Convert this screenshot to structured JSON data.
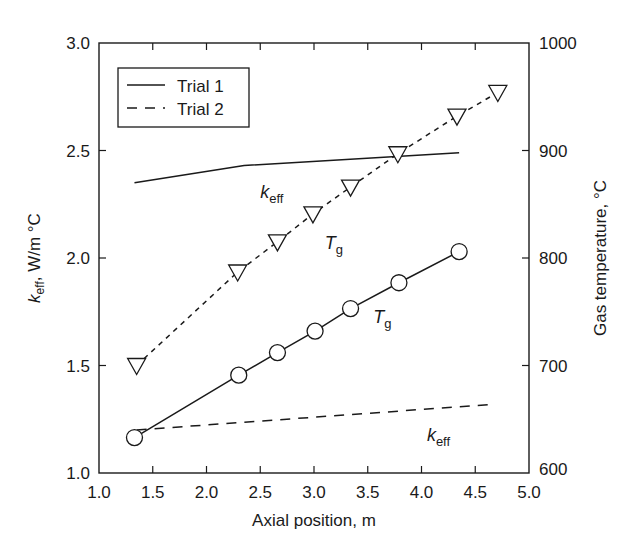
{
  "chart_data": {
    "type": "line",
    "title": "",
    "xlabel": "Axial position, m",
    "ylabel_left": {
      "symbol": "k",
      "subscript": "eff",
      "unit": ", W/m °C"
    },
    "ylabel_right": "Gas temperature, °C",
    "xlim": [
      1.0,
      5.0
    ],
    "ylim_left": [
      1.0,
      3.0
    ],
    "ylim_right": [
      600,
      1000
    ],
    "x_ticks": [
      "1.0",
      "1.5",
      "2.0",
      "2.5",
      "3.0",
      "3.5",
      "4.0",
      "4.5",
      "5.0"
    ],
    "y_left_ticks": [
      "1.0",
      "1.5",
      "2.0",
      "2.5",
      "3.0"
    ],
    "y_right_ticks": [
      "600",
      "700",
      "800",
      "900",
      "1000"
    ],
    "grid": false,
    "legend": {
      "position": "upper-left",
      "entries": [
        {
          "label": "Trial 1",
          "style": "solid"
        },
        {
          "label": "Trial 2",
          "style": "dashed"
        }
      ]
    },
    "series": [
      {
        "name": "Trial 1 k_eff",
        "axis": "left",
        "style": "solid",
        "marker": "none",
        "x": [
          1.33,
          2.35,
          4.35
        ],
        "y": [
          2.35,
          2.43,
          2.49
        ]
      },
      {
        "name": "Trial 2 k_eff",
        "axis": "left",
        "style": "dashed",
        "marker": "none",
        "x": [
          1.35,
          4.68
        ],
        "y": [
          1.2,
          1.32
        ]
      },
      {
        "name": "Trial 1 T_g",
        "axis": "right",
        "style": "solid",
        "marker": "circle",
        "x": [
          1.33,
          2.3,
          2.66,
          3.01,
          3.34,
          3.79,
          4.35
        ],
        "y": [
          633,
          691,
          712,
          732,
          753,
          777,
          806
        ]
      },
      {
        "name": "Trial 2 T_g",
        "axis": "right",
        "style": "dotted",
        "marker": "triangle-down",
        "x": [
          1.35,
          2.29,
          2.66,
          2.99,
          3.34,
          3.78,
          4.33,
          4.71
        ],
        "y": [
          700,
          787,
          815,
          841,
          866,
          897,
          932,
          954
        ]
      }
    ],
    "annotations": [
      {
        "text": "k",
        "sub": "eff",
        "x": 2.5,
        "y_left": 2.28,
        "series": "Trial 1 k_eff"
      },
      {
        "text": "T",
        "sub": "g",
        "x": 3.1,
        "y_left": 2.04,
        "series": "Trial 2 T_g"
      },
      {
        "text": "T",
        "sub": "g",
        "x": 3.55,
        "y_left": 1.7,
        "series": "Trial 1 T_g"
      },
      {
        "text": "k",
        "sub": "eff",
        "x": 4.05,
        "y_left": 1.15,
        "series": "Trial 2 k_eff"
      }
    ]
  }
}
